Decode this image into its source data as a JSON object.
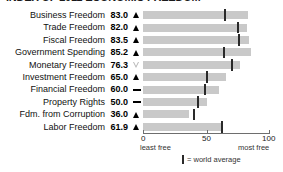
{
  "chart_data": {
    "type": "bar",
    "title": "INDEX OF 2011 ECONOMIC FREEDOM",
    "orientation": "horizontal",
    "xlabel": "",
    "ylabel": "",
    "xlim": [
      0,
      100
    ],
    "grid": false,
    "categories": [
      "Business Freedom",
      "Trade Freedom",
      "Fiscal Freedom",
      "Government Spending",
      "Monetary Freedom",
      "Investment Freedom",
      "Financial Freedom",
      "Property Rights",
      "Fdm. from Corruption",
      "Labor Freedom"
    ],
    "values": [
      83.0,
      82.0,
      83.5,
      85.2,
      76.3,
      65.0,
      60.0,
      50.0,
      36.0,
      61.9
    ],
    "value_labels": [
      "83.0",
      "82.0",
      "83.5",
      "85.2",
      "76.3",
      "65.0",
      "60.0",
      "50.0",
      "36.0",
      "61.9"
    ],
    "trend_markers": [
      "up",
      "up",
      "up",
      "up",
      "down",
      "up",
      "flat",
      "flat",
      "up",
      "up"
    ],
    "world_average": [
      64.3,
      74.8,
      75.4,
      63.9,
      70.0,
      50.2,
      48.5,
      43.6,
      40.5,
      62.1
    ],
    "axis_ticks": [
      "0",
      "50",
      "100"
    ],
    "axis_tick_values": [
      0,
      50,
      100
    ],
    "axis_end_labels": {
      "left": "least free",
      "right": "most free"
    },
    "legend": {
      "marker_label": "= world average",
      "position": "bottom-center"
    },
    "colors": {
      "bar": "#c9c9c9",
      "average_tick": "#2a2a2a",
      "text": "#111111",
      "axis": "#6e6e6e",
      "background": "#ffffff",
      "marker_up": "#000000",
      "marker_down": "#b5b5b5",
      "marker_flat": "#000000"
    }
  }
}
